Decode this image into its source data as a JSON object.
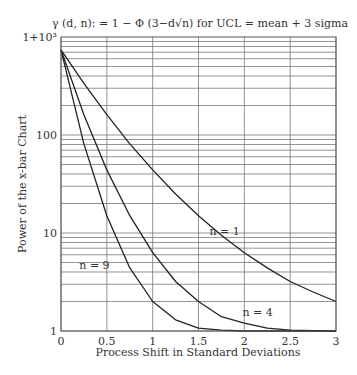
{
  "chart_data": {
    "type": "line",
    "title": "γ (d, n): = 1 − Φ (3−d√n) for UCL = mean + 3 sigma",
    "xlabel": "Process Shift in Standard Deviations",
    "ylabel": "Power of the x-bar Chart",
    "x_scale": "linear",
    "y_scale": "log",
    "xlim": [
      0,
      3
    ],
    "ylim": [
      1,
      1000
    ],
    "x_ticks": [
      "0",
      "0.5",
      "1",
      "1.5",
      "2",
      "2.5",
      "3"
    ],
    "y_ticks": [
      {
        "value": 1,
        "label": "1"
      },
      {
        "value": 10,
        "label": "10"
      },
      {
        "value": 100,
        "label": "100"
      },
      {
        "value": 1000,
        "label": "1+10³"
      }
    ],
    "grid": true,
    "x": [
      0,
      0.25,
      0.5,
      0.75,
      1.0,
      1.25,
      1.5,
      1.75,
      2.0,
      2.25,
      2.5,
      2.75,
      3.0
    ],
    "series": [
      {
        "name": "n = 1",
        "label_pos": [
          1.62,
          9.6
        ],
        "values": [
          741,
          336,
          161,
          81.2,
          44.0,
          25.0,
          15.0,
          9.5,
          6.3,
          4.4,
          3.2,
          2.5,
          2.0
        ]
      },
      {
        "name": "n = 4",
        "label_pos": [
          1.98,
          1.42
        ],
        "values": [
          741,
          161,
          44.0,
          15.0,
          6.3,
          3.2,
          2.0,
          1.4,
          1.2,
          1.07,
          1.02,
          1.01,
          1.0
        ]
      },
      {
        "name": "n = 9",
        "label_pos": [
          0.2,
          4.3
        ],
        "values": [
          741,
          81.2,
          15.0,
          4.4,
          2.0,
          1.3,
          1.07,
          1.02,
          1.0,
          1.0,
          1.0,
          1.0,
          1.0
        ]
      }
    ]
  }
}
